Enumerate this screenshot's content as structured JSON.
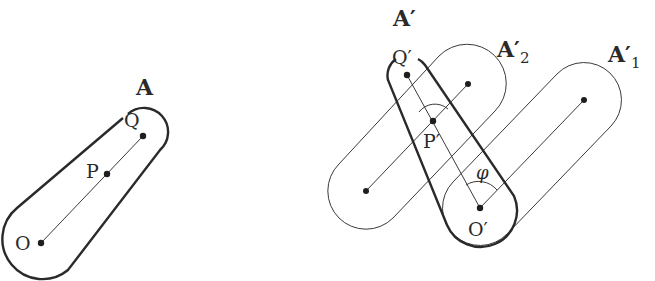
{
  "figure": {
    "left": {
      "shape_label": "A",
      "points": {
        "O": {
          "label": "O",
          "x": 41,
          "y": 243
        },
        "P": {
          "label": "P",
          "x": 107,
          "y": 174
        },
        "Q": {
          "label": "Q",
          "x": 143,
          "y": 136
        }
      }
    },
    "right": {
      "shape_label": "A′",
      "shape2_label": "A′",
      "shape2_sub": "2",
      "shape1_label": "A′",
      "shape1_sub": "1",
      "angle_label": "φ",
      "points": {
        "O": {
          "label": "O′",
          "x": 480,
          "y": 208
        },
        "P": {
          "label": "P′",
          "x": 433,
          "y": 121
        },
        "Q": {
          "label": "Q′",
          "x": 407,
          "y": 75
        },
        "A2_end1": {
          "x": 366,
          "y": 191
        },
        "A2_end2": {
          "x": 468,
          "y": 84
        },
        "A1_end": {
          "x": 584,
          "y": 100
        }
      }
    },
    "colors": {
      "ink": "#2a2a2a",
      "background": "#ffffff"
    }
  }
}
